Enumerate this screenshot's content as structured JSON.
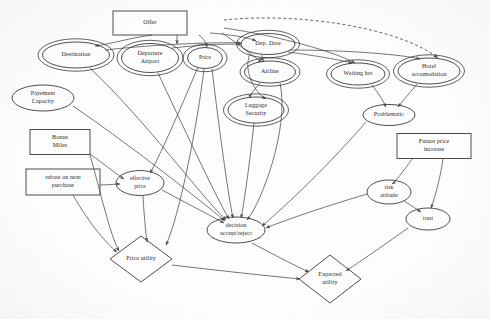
{
  "diagram": {
    "colors": {
      "background": "#ffffff",
      "node_stroke": "#3a3a3a",
      "edge_stroke": "#4a4a4a",
      "text": "#2b2b2b"
    },
    "nodes": [
      {
        "id": "offer",
        "label": "Offer",
        "lines": [
          "Offer"
        ],
        "shape": "rect",
        "x": 150,
        "y": 23,
        "w": 74,
        "h": 24
      },
      {
        "id": "destination",
        "label": "Destination",
        "lines": [
          "Destination"
        ],
        "shape": "ellipse-double",
        "x": 76,
        "y": 55,
        "w": 67,
        "h": 26
      },
      {
        "id": "dep_airport",
        "label": "Departure Airport",
        "lines": [
          "Departure",
          "Airport"
        ],
        "shape": "ellipse-double",
        "x": 150,
        "y": 58,
        "w": 57,
        "h": 29
      },
      {
        "id": "price",
        "label": "Price",
        "lines": [
          "Price"
        ],
        "shape": "ellipse-double",
        "x": 205,
        "y": 58,
        "w": 35,
        "h": 21
      },
      {
        "id": "dep_date",
        "label": "Dep. Date",
        "lines": [
          "Dep. Date"
        ],
        "shape": "ellipse-double",
        "x": 268,
        "y": 44,
        "w": 54,
        "h": 21
      },
      {
        "id": "airline",
        "label": "Airline",
        "lines": [
          "Airline"
        ],
        "shape": "ellipse-double",
        "x": 270,
        "y": 72,
        "w": 51,
        "h": 22
      },
      {
        "id": "waiting_hrs",
        "label": "Waiting hrs",
        "lines": [
          "Waiting hrs"
        ],
        "shape": "ellipse-double",
        "x": 358,
        "y": 74,
        "w": 54,
        "h": 22
      },
      {
        "id": "hotel",
        "label": "Hotel accomodation",
        "lines": [
          "Hotel",
          "accomodation"
        ],
        "shape": "ellipse-double",
        "x": 429,
        "y": 71,
        "w": 62,
        "h": 26
      },
      {
        "id": "luggage",
        "label": "Luggage Security",
        "lines": [
          "Luggage",
          "Security"
        ],
        "shape": "ellipse-double",
        "x": 256,
        "y": 110,
        "w": 56,
        "h": 26
      },
      {
        "id": "problematic",
        "label": "Problematic",
        "lines": [
          "Problematic"
        ],
        "shape": "ellipse",
        "x": 389,
        "y": 115,
        "w": 52,
        "h": 21
      },
      {
        "id": "payement",
        "label": "Payement Capacity",
        "lines": [
          "Payement",
          "Capacity"
        ],
        "shape": "ellipse",
        "x": 43,
        "y": 98,
        "w": 62,
        "h": 26
      },
      {
        "id": "bonus",
        "label": "Bonus Miles",
        "lines": [
          "Bonus",
          "Miles"
        ],
        "shape": "rect",
        "x": 60,
        "y": 142,
        "w": 60,
        "h": 25
      },
      {
        "id": "rebate",
        "label": "rebate on next purchase",
        "lines": [
          "rebate on next",
          "purchase"
        ],
        "shape": "rect",
        "x": 63,
        "y": 182,
        "w": 74,
        "h": 26
      },
      {
        "id": "eff_price",
        "label": "effective price",
        "lines": [
          "effective",
          "price"
        ],
        "shape": "ellipse",
        "x": 140,
        "y": 183,
        "w": 48,
        "h": 25
      },
      {
        "id": "future_price",
        "label": "Future price increase",
        "lines": [
          "Future price",
          "increase"
        ],
        "shape": "rect",
        "x": 434,
        "y": 146,
        "w": 74,
        "h": 25
      },
      {
        "id": "risk",
        "label": "risk attitude",
        "lines": [
          "risk",
          "attitude"
        ],
        "shape": "ellipse",
        "x": 389,
        "y": 192,
        "w": 44,
        "h": 24
      },
      {
        "id": "trust",
        "label": "trust",
        "lines": [
          "trust"
        ],
        "shape": "ellipse",
        "x": 428,
        "y": 219,
        "w": 44,
        "h": 22
      },
      {
        "id": "decision",
        "label": "decision accept/reject",
        "lines": [
          "decision",
          "accept/reject"
        ],
        "shape": "ellipse",
        "x": 236,
        "y": 230,
        "w": 58,
        "h": 26
      },
      {
        "id": "price_util",
        "label": "Price utility",
        "lines": [
          "Price utility"
        ],
        "shape": "diamond",
        "x": 141,
        "y": 259,
        "w": 62,
        "h": 46
      },
      {
        "id": "exp_util",
        "label": "Expected utility",
        "lines": [
          "Expected",
          "utility"
        ],
        "shape": "diamond",
        "x": 330,
        "y": 279,
        "w": 62,
        "h": 48
      }
    ],
    "edges": [
      {
        "from": "offer",
        "to": "destination",
        "style": "solid",
        "path": "M 152,35 C 130,38 110,44 95,46"
      },
      {
        "from": "offer",
        "to": "dep_airport",
        "style": "solid",
        "path": "M 177,35 L 177,44"
      },
      {
        "from": "offer",
        "to": "price",
        "style": "solid",
        "path": "M 199,35 C 205,40 206,43 207,47"
      },
      {
        "from": "offer",
        "to": "dep_date",
        "style": "solid",
        "path": "M 210,33 C 235,35 250,38 256,41"
      },
      {
        "from": "offer",
        "to": "airline",
        "style": "solid",
        "path": "M 222,33 C 240,45 255,58 262,62"
      },
      {
        "from": "offer",
        "to": "waiting_hrs",
        "style": "solid",
        "path": "M 224,28 C 280,36 335,52 355,63"
      },
      {
        "from": "offer",
        "to": "hotel",
        "style": "dashed",
        "path": "M 224,20 C 300,12 400,28 438,58"
      },
      {
        "from": "dep_date",
        "to": "airline",
        "style": "solid",
        "path": "M 262,55 C 262,58 263,60 264,61"
      },
      {
        "from": "dep_date",
        "to": "waiting_hrs",
        "style": "solid",
        "path": "M 288,52 C 318,56 340,60 352,63"
      },
      {
        "from": "dep_date",
        "to": "hotel",
        "style": "solid",
        "path": "M 290,50 C 350,50 405,55 420,59"
      },
      {
        "from": "destination",
        "to": "dep_date",
        "style": "solid",
        "path": "M 105,50 C 160,44 215,42 241,43"
      },
      {
        "from": "dep_airport",
        "to": "dep_date",
        "style": "solid",
        "path": "M 172,48 C 200,45 220,44 241,44"
      },
      {
        "from": "airline",
        "to": "luggage",
        "style": "solid",
        "path": "M 260,83 C 254,90 250,95 250,98"
      },
      {
        "from": "dep_date",
        "to": "luggage",
        "style": "solid",
        "path": "M 250,54 C 243,70 254,92 266,99"
      },
      {
        "from": "waiting_hrs",
        "to": "problematic",
        "style": "solid",
        "path": "M 372,85 C 380,95 384,103 386,107"
      },
      {
        "from": "hotel",
        "to": "problematic",
        "style": "solid",
        "path": "M 417,84 C 408,95 401,103 398,107"
      },
      {
        "from": "destination",
        "to": "decision",
        "style": "solid",
        "path": "M 90,68 C 145,120 200,195 226,220"
      },
      {
        "from": "dep_airport",
        "to": "decision",
        "style": "solid",
        "path": "M 158,73 C 180,120 215,195 229,219"
      },
      {
        "from": "price",
        "to": "eff_price",
        "style": "solid",
        "path": "M 198,67 C 180,110 158,160 150,173"
      },
      {
        "from": "price",
        "to": "price_util",
        "style": "solid",
        "path": "M 204,69 C 198,120 180,215 166,245"
      },
      {
        "from": "price",
        "to": "decision",
        "style": "solid",
        "path": "M 212,69 C 218,120 228,195 233,218"
      },
      {
        "from": "luggage",
        "to": "decision",
        "style": "solid",
        "path": "M 254,123 C 250,160 244,205 241,218"
      },
      {
        "from": "airline",
        "to": "decision",
        "style": "solid",
        "path": "M 280,83 C 290,130 260,205 247,220"
      },
      {
        "from": "problematic",
        "to": "decision",
        "style": "solid",
        "path": "M 366,122 C 320,175 275,215 262,226"
      },
      {
        "from": "payement",
        "to": "decision",
        "style": "solid",
        "path": "M 73,106 C 130,145 200,200 225,221"
      },
      {
        "from": "bonus",
        "to": "eff_price",
        "style": "solid",
        "path": "M 90,154 C 105,165 118,175 124,179"
      },
      {
        "from": "bonus",
        "to": "price_util",
        "style": "solid",
        "path": "M 90,155 C 100,190 110,235 119,251"
      },
      {
        "from": "rebate",
        "to": "eff_price",
        "style": "solid",
        "path": "M 100,185 C 108,185 114,184 120,184"
      },
      {
        "from": "rebate",
        "to": "price_util",
        "style": "solid",
        "path": "M 73,195 C 90,225 108,245 117,252"
      },
      {
        "from": "eff_price",
        "to": "decision",
        "style": "solid",
        "path": "M 162,190 C 190,205 215,218 224,223"
      },
      {
        "from": "eff_price",
        "to": "price_util",
        "style": "solid",
        "path": "M 143,196 C 144,215 146,235 147,242"
      },
      {
        "from": "price_util",
        "to": "exp_util",
        "style": "solid",
        "path": "M 172,265 C 230,272 280,277 300,279"
      },
      {
        "from": "decision",
        "to": "exp_util",
        "style": "solid",
        "path": "M 252,243 C 280,258 300,268 309,272"
      },
      {
        "from": "future_price",
        "to": "risk",
        "style": "solid",
        "path": "M 412,159 C 403,172 395,182 392,184"
      },
      {
        "from": "future_price",
        "to": "trust",
        "style": "solid",
        "path": "M 443,159 C 440,180 434,200 431,208"
      },
      {
        "from": "risk",
        "to": "trust",
        "style": "solid",
        "path": "M 404,201 C 412,206 418,210 421,212"
      },
      {
        "from": "risk",
        "to": "decision",
        "style": "solid",
        "path": "M 367,194 C 320,208 280,222 266,228"
      },
      {
        "from": "trust",
        "to": "exp_util",
        "style": "solid",
        "path": "M 408,228 C 380,248 355,265 346,271"
      }
    ]
  }
}
